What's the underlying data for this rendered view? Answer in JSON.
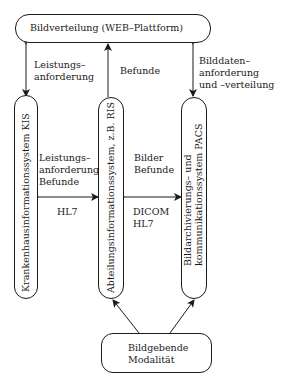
{
  "diagram": {
    "nodes": {
      "web": {
        "label": "Bildverteilung (WEB–Plattform)"
      },
      "kis": {
        "label": "Krankenhausinformationssystem KIS"
      },
      "ris": {
        "label": "Abteilungsinformationssystem, z.B. RIS"
      },
      "pacs": {
        "line1": "Bildarchivierungs– und",
        "line2": "kommunikationssystem PACS"
      },
      "modality": {
        "line1": "Bildgebende",
        "line2": "Modalität"
      }
    },
    "edges": {
      "web_kis": {
        "line1": "Leistungs–",
        "line2": "anforderung",
        "direction": "both"
      },
      "ris_web": {
        "line1": "Befunde",
        "direction": "to-web"
      },
      "web_pacs": {
        "line1": "Bilddaten–",
        "line2": "anforderung",
        "line3": "und –verteilung",
        "direction": "both"
      },
      "kis_ris": {
        "line1": "Leistungs–",
        "line2": "anforderung",
        "line3": "Befunde",
        "protocol": "HL7",
        "direction": "both"
      },
      "ris_pacs": {
        "line1": "Bilder",
        "line2": "Befunde",
        "protocol1": "DICOM",
        "protocol2": "HL7",
        "direction": "both"
      },
      "modality_ris": {
        "direction": "to-ris"
      },
      "modality_pacs": {
        "direction": "to-pacs"
      }
    }
  }
}
